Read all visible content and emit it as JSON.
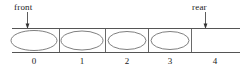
{
  "diagram": {
    "type": "queue-array-diagram",
    "stroke_color": "#555555",
    "text_color": "#1a1a1a",
    "background_color": "#ffffff",
    "pointers": [
      {
        "name": "front",
        "label": "front",
        "target_index": 0
      },
      {
        "name": "rear",
        "label": "rear",
        "target_index": 4
      }
    ],
    "cells": [
      {
        "index_label": "0",
        "occupied": true
      },
      {
        "index_label": "1",
        "occupied": true
      },
      {
        "index_label": "2",
        "occupied": true
      },
      {
        "index_label": "3",
        "occupied": true
      },
      {
        "index_label": "4",
        "occupied": false
      }
    ]
  }
}
